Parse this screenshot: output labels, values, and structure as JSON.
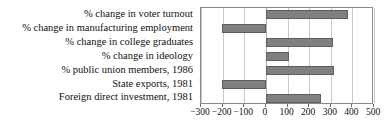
{
  "chart_data": {
    "type": "bar",
    "orientation": "horizontal",
    "title": "",
    "xlabel": "",
    "ylabel": "",
    "xlim": [
      -300,
      500
    ],
    "xticks": [
      -300,
      -200,
      -100,
      0,
      100,
      200,
      300,
      400,
      500
    ],
    "xtick_labels": [
      "−300",
      "−200",
      "−100",
      "0",
      "100",
      "200",
      "300",
      "400",
      "500"
    ],
    "grid": true,
    "legend": false,
    "bar_color": "#808080",
    "bar_edge_color": "#5e5e5e",
    "frame_color": "#8a8a8a",
    "gridline_color": "#c9c9c9",
    "categories": [
      "% change in voter turnout",
      "% change in manufacturing employment",
      "% change in college graduates",
      "% change in ideology",
      "% public union members, 1986",
      "State exports, 1981",
      "Foreign direct investment, 1981"
    ],
    "values": [
      378,
      -205,
      310,
      105,
      315,
      -205,
      255
    ]
  }
}
